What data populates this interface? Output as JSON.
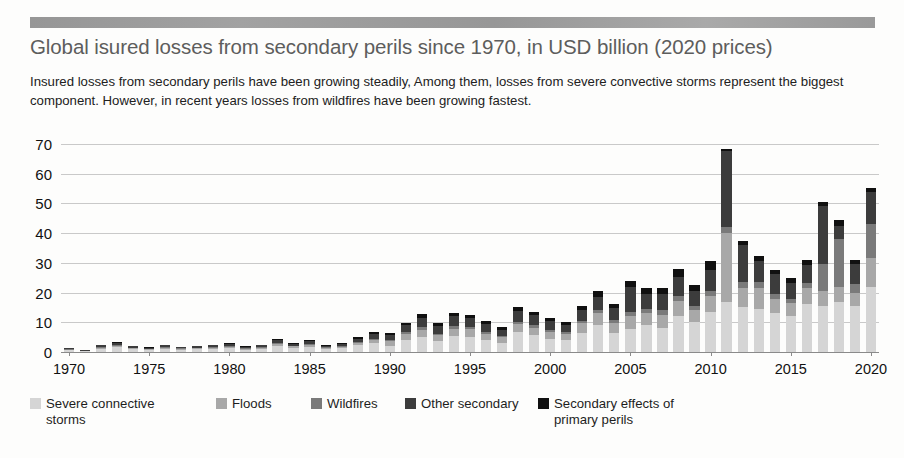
{
  "header": {
    "title": "Global isured losses from secondary perils since 1970, in USD billion (2020 prices)",
    "subtitle": "Insured losses from secondary perils have been growing steadily, Among them, losses from severe convective storms represent the biggest component. However, in recent years losses from wildfires have been growing fastest."
  },
  "colors": {
    "severe_convective_storms": "#d5d5d5",
    "floods": "#a8a8a8",
    "wildfires": "#7a7a7a",
    "other_secondary": "#3c3c3c",
    "secondary_effects_of_primary_perils": "#101010",
    "gridline": "#c9c9c9",
    "axis": "#8a8a8a",
    "title_text": "#5d5d5d",
    "body_text": "#212121"
  },
  "legend": {
    "position": "bottom",
    "items": [
      {
        "label": "Severe connective\nstorms",
        "color": "#d5d5d5"
      },
      {
        "label": "Floods",
        "color": "#a8a8a8"
      },
      {
        "label": "Wildfires",
        "color": "#7a7a7a"
      },
      {
        "label": "Other secondary",
        "color": "#3c3c3c"
      },
      {
        "label": "Secondary effects of\nprimary perils",
        "color": "#101010"
      }
    ]
  },
  "chart_data": {
    "type": "bar",
    "stacked": true,
    "title": "Global isured losses from secondary perils since 1970, in USD billion (2020 prices)",
    "subtitle": "Insured losses from secondary perils have been growing steadily, Among them, losses from severe convective storms represent the biggest component. However, in recent years losses from wildfires have been growing fastest.",
    "xlabel": "",
    "ylabel": "",
    "ylim": [
      0,
      70
    ],
    "yticks": [
      0,
      10,
      20,
      30,
      40,
      50,
      60,
      70
    ],
    "ytick_labels": [
      "0",
      "10",
      "20",
      "30",
      "40",
      "50",
      "60",
      "70"
    ],
    "xticks": [
      1970,
      1975,
      1980,
      1985,
      1990,
      1995,
      2000,
      2005,
      2010,
      2015,
      2020
    ],
    "xtick_labels": [
      "1970",
      "1975",
      "1980",
      "1985",
      "1990",
      "1995",
      "2000",
      "2005",
      "2010",
      "2015",
      "2020"
    ],
    "grid": true,
    "grid_axis": "y",
    "categories": [
      1970,
      1971,
      1972,
      1973,
      1974,
      1975,
      1976,
      1977,
      1978,
      1979,
      1980,
      1981,
      1982,
      1983,
      1984,
      1985,
      1986,
      1987,
      1988,
      1989,
      1990,
      1991,
      1992,
      1993,
      1994,
      1995,
      1996,
      1997,
      1998,
      1999,
      2000,
      2001,
      2002,
      2003,
      2004,
      2005,
      2006,
      2007,
      2008,
      2009,
      2010,
      2011,
      2012,
      2013,
      2014,
      2015,
      2016,
      2017,
      2018,
      2019,
      2020
    ],
    "series": [
      {
        "name": "Severe connective storms",
        "color": "#d5d5d5",
        "values": [
          0.6,
          0.3,
          1.1,
          1.6,
          1.0,
          0.7,
          1.0,
          0.8,
          0.9,
          1.1,
          1.3,
          0.8,
          1.1,
          2.0,
          1.4,
          1.8,
          1.0,
          1.3,
          2.2,
          3.0,
          2.1,
          4.2,
          5.0,
          3.6,
          5.3,
          5.0,
          4.0,
          3.2,
          6.8,
          5.6,
          4.5,
          4.0,
          6.4,
          9.2,
          6.3,
          7.8,
          9.0,
          8.0,
          12.0,
          10.0,
          13.5,
          17.0,
          15.0,
          14.5,
          13.0,
          12.0,
          16.0,
          15.5,
          17.0,
          15.5,
          22.0
        ]
      },
      {
        "name": "Floods",
        "color": "#a8a8a8",
        "values": [
          0.2,
          0.1,
          0.4,
          0.5,
          0.3,
          0.3,
          0.4,
          0.3,
          0.3,
          0.4,
          0.5,
          0.3,
          0.4,
          0.6,
          0.5,
          0.6,
          0.4,
          0.5,
          0.8,
          1.0,
          1.6,
          2.0,
          2.5,
          2.0,
          2.6,
          2.6,
          2.2,
          1.8,
          2.6,
          2.6,
          2.3,
          2.1,
          3.2,
          3.8,
          3.4,
          4.4,
          4.2,
          4.6,
          5.2,
          4.2,
          5.5,
          23.0,
          6.5,
          7.0,
          5.0,
          4.5,
          5.5,
          5.0,
          5.0,
          4.5,
          9.5
        ]
      },
      {
        "name": "Wildfires",
        "color": "#7a7a7a",
        "values": [
          0.1,
          0.1,
          0.2,
          0.2,
          0.1,
          0.1,
          0.2,
          0.1,
          0.2,
          0.2,
          0.2,
          0.1,
          0.2,
          0.3,
          0.2,
          0.3,
          0.2,
          0.2,
          0.3,
          0.4,
          0.5,
          0.6,
          0.8,
          0.6,
          0.8,
          0.8,
          0.7,
          0.5,
          0.8,
          0.8,
          0.7,
          0.6,
          0.9,
          1.1,
          1.0,
          1.3,
          1.2,
          1.4,
          1.6,
          1.3,
          1.7,
          2.0,
          2.0,
          2.1,
          1.6,
          1.4,
          1.8,
          9.0,
          16.0,
          3.0,
          11.5
        ]
      },
      {
        "name": "Other secondary",
        "color": "#3c3c3c",
        "values": [
          0.3,
          0.2,
          0.5,
          0.8,
          0.5,
          0.4,
          0.6,
          0.4,
          0.5,
          0.6,
          0.7,
          0.5,
          0.6,
          1.0,
          0.7,
          0.9,
          0.5,
          0.7,
          1.2,
          1.6,
          1.5,
          2.2,
          3.2,
          2.5,
          3.3,
          3.0,
          2.6,
          2.0,
          3.5,
          3.3,
          2.8,
          2.5,
          3.5,
          4.5,
          4.0,
          8.5,
          5.0,
          5.5,
          6.5,
          5.0,
          7.0,
          25.5,
          12.5,
          7.0,
          6.5,
          5.5,
          6.0,
          19.5,
          4.5,
          6.5,
          11.0
        ]
      },
      {
        "name": "Secondary effects of primary perils",
        "color": "#101010",
        "values": [
          0.1,
          0.1,
          0.2,
          0.3,
          0.2,
          0.2,
          0.2,
          0.2,
          0.2,
          0.2,
          0.3,
          0.2,
          0.2,
          0.4,
          0.3,
          0.3,
          0.2,
          0.3,
          0.5,
          0.6,
          0.6,
          0.9,
          1.3,
          1.0,
          1.3,
          1.2,
          1.0,
          0.8,
          1.4,
          1.3,
          1.1,
          1.0,
          1.4,
          1.8,
          1.6,
          2.0,
          2.0,
          2.2,
          2.6,
          2.0,
          2.8,
          1.0,
          1.5,
          1.8,
          1.6,
          1.4,
          1.6,
          1.5,
          1.8,
          1.5,
          1.2
        ]
      }
    ],
    "totals": [
      1.3,
      0.8,
      2.4,
      3.4,
      2.1,
      1.7,
      2.4,
      1.8,
      2.1,
      2.5,
      3.0,
      1.9,
      2.5,
      4.3,
      3.1,
      3.9,
      2.3,
      3.0,
      5.0,
      6.6,
      6.3,
      9.9,
      12.8,
      9.7,
      13.3,
      12.6,
      10.5,
      8.3,
      15.1,
      13.6,
      11.4,
      10.2,
      15.4,
      20.4,
      16.3,
      24.0,
      21.4,
      21.7,
      27.9,
      22.5,
      30.5,
      68.5,
      37.5,
      32.4,
      27.7,
      24.8,
      30.9,
      50.5,
      44.3,
      31.0,
      55.2
    ]
  }
}
